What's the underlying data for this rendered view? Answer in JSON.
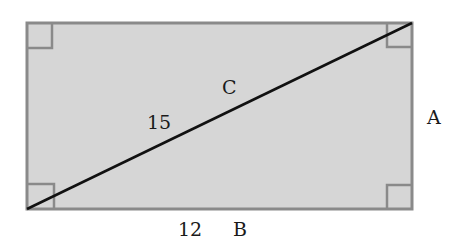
{
  "diagram": {
    "shape": "rectangle",
    "fill_color": "#d6d6d6",
    "border_color": "#8a8a8a",
    "diagonal_color": "#111111",
    "labels": {
      "diagonal_name": "C",
      "diagonal_length": "15",
      "side_right": "A",
      "bottom_length": "12",
      "bottom_name": "B"
    },
    "right_angle_markers": [
      "top-left",
      "top-right",
      "bottom-left",
      "bottom-right"
    ]
  }
}
